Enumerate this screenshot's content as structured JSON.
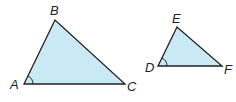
{
  "diagram": {
    "fill_color": "#c9eaf4",
    "stroke_color": "#231f20",
    "triangles": [
      {
        "name": "ABC",
        "vertices": {
          "A": {
            "label": "A",
            "x": 24,
            "y": 84
          },
          "B": {
            "label": "B",
            "x": 55,
            "y": 20
          },
          "C": {
            "label": "C",
            "x": 125,
            "y": 84
          }
        },
        "marked_angle": "A"
      },
      {
        "name": "DEF",
        "vertices": {
          "D": {
            "label": "D",
            "x": 158,
            "y": 66
          },
          "E": {
            "label": "E",
            "x": 177,
            "y": 27
          },
          "F": {
            "label": "F",
            "x": 222,
            "y": 66
          }
        },
        "marked_angle": "D"
      }
    ]
  }
}
